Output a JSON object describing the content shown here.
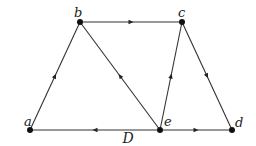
{
  "diagram": {
    "caption": "D",
    "nodes": [
      {
        "id": "a",
        "label": "a"
      },
      {
        "id": "b",
        "label": "b"
      },
      {
        "id": "c",
        "label": "c"
      },
      {
        "id": "d",
        "label": "d"
      },
      {
        "id": "e",
        "label": "e"
      }
    ],
    "edges": [
      {
        "from": "a",
        "to": "b"
      },
      {
        "from": "e",
        "to": "b"
      },
      {
        "from": "b",
        "to": "c"
      },
      {
        "from": "e",
        "to": "c"
      },
      {
        "from": "c",
        "to": "d"
      },
      {
        "from": "e",
        "to": "a"
      },
      {
        "from": "e",
        "to": "d"
      }
    ]
  }
}
